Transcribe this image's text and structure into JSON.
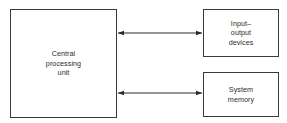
{
  "figure": {
    "background_color": "#ffffff",
    "stroke_color": "#3a3a3a",
    "text_color": "#2b2b2b"
  },
  "blocks": {
    "cpu": {
      "label": "Central\nprocessing\nunit",
      "lines": [
        "Central",
        "processing",
        "unit"
      ]
    },
    "io": {
      "label": "Input–\noutput\ndevices",
      "lines": [
        "Input–",
        "output",
        "devices"
      ]
    },
    "memory": {
      "label": "System\nmemory",
      "lines": [
        "System",
        "memory"
      ]
    }
  },
  "connectors": [
    {
      "name": "cpu-io-bus",
      "from": "cpu",
      "to": "io",
      "style": "double-headed-arrow",
      "direction": "bidirectional",
      "label": ""
    },
    {
      "name": "cpu-memory-bus",
      "from": "cpu",
      "to": "memory",
      "style": "double-headed-arrow",
      "direction": "bidirectional",
      "label": ""
    }
  ]
}
